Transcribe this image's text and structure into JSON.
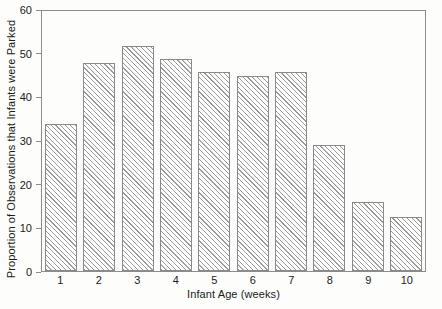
{
  "chart_data": {
    "type": "bar",
    "title": "",
    "xlabel": "Infant Age (weeks)",
    "ylabel": "Proportion of Observations that Infants were Parked",
    "categories": [
      "1",
      "2",
      "3",
      "4",
      "5",
      "6",
      "7",
      "8",
      "9",
      "10"
    ],
    "values": [
      34,
      48,
      52,
      49,
      46,
      45,
      46,
      29,
      16,
      12.5
    ],
    "ylim": [
      0,
      60
    ],
    "yticks": [
      0,
      10,
      20,
      30,
      40,
      50,
      60
    ],
    "xlim_note": "categorical, 10 bars",
    "grid": false,
    "legend": "none",
    "bar_style": {
      "fill": "diagonal-hatch",
      "hatch_color": "#9a9a9a",
      "edge_color": "#8a8a8a",
      "face_color": "#ffffff"
    },
    "frame": {
      "box": true,
      "color": "#8c8c8c"
    },
    "background": "#fdfdfc"
  }
}
